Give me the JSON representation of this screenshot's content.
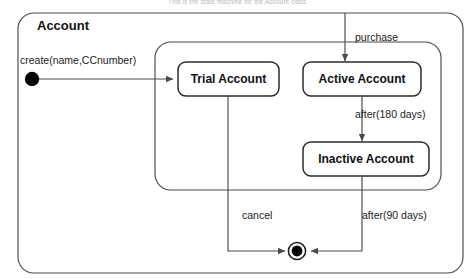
{
  "caption": "This is the state machine for the Account class.",
  "diagram": {
    "type": "uml-state-machine",
    "frame_title": "Account",
    "colors": {
      "stroke": "#4a4a4a",
      "state_stroke": "#2b2b2b",
      "text": "#1b1b1b",
      "final_state_fill": "#000000",
      "initial_state_fill": "#000000",
      "background": "#ffffff",
      "caption_text": "#b9b9bd"
    },
    "states": [
      {
        "id": "trial",
        "label": "Trial Account"
      },
      {
        "id": "active",
        "label": "Active Account"
      },
      {
        "id": "inactive",
        "label": "Inactive Account"
      }
    ],
    "pseudostates": [
      {
        "id": "initial",
        "kind": "initial"
      },
      {
        "id": "final",
        "kind": "final"
      }
    ],
    "transitions": [
      {
        "from": "initial",
        "to": "trial",
        "label": "create(name,CCnumber)"
      },
      {
        "from": "external",
        "to": "active",
        "label": "purchase"
      },
      {
        "from": "active",
        "to": "inactive",
        "label": "after(180 days)"
      },
      {
        "from": "trial",
        "to": "final",
        "label": "cancel"
      },
      {
        "from": "inactive",
        "to": "final",
        "label": "after(90 days)"
      }
    ]
  }
}
